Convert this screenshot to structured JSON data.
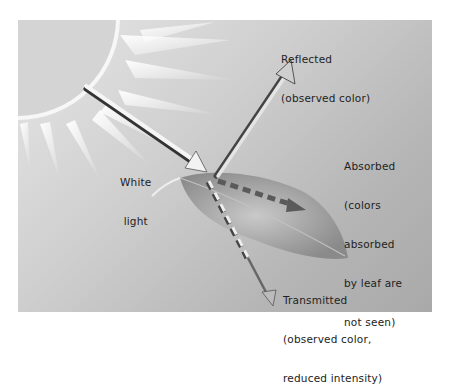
{
  "diagram": {
    "title": "",
    "colors": {
      "background": "#ffffff",
      "panel_light": "#e6e6e6",
      "panel_dark": "#a9a9a9",
      "sun": "#d2d2d2",
      "ray": "#f4f4f4",
      "leaf": "#9a9a9a",
      "arrow_light": "#f2f2f2",
      "arrow_shadow": "#333333",
      "dash": "#5a5a5a",
      "text": "#222222"
    },
    "labels": {
      "white_light": [
        "White",
        "light"
      ],
      "reflected": [
        "Reflected",
        "(observed color)"
      ],
      "absorbed": [
        "Absorbed",
        "(colors",
        "absorbed",
        "by leaf are",
        "not seen)"
      ],
      "transmitted": [
        "Transmitted",
        "(observed color,",
        "reduced intensity)"
      ]
    },
    "elements": {
      "sun": "sun-icon",
      "leaf": "leaf-icon",
      "incoming_arrow": "white-light-arrow",
      "reflected_arrow": "reflected-arrow",
      "absorbed_arrow": "absorbed-dashed-arrow",
      "transmitted_arrow": "transmitted-dashed-arrow"
    }
  }
}
